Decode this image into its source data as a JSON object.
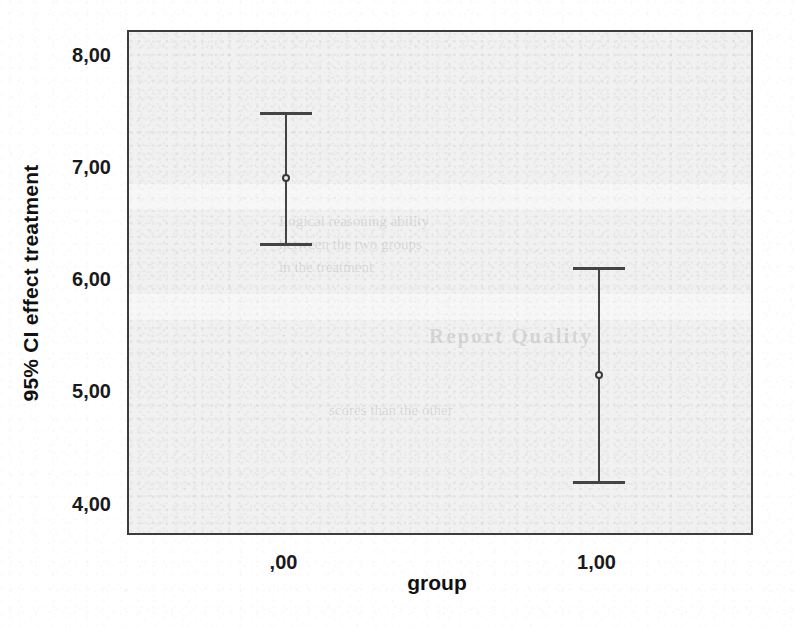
{
  "chart_data": {
    "type": "scatter",
    "title": "",
    "subtitle": "",
    "xlabel": "group",
    "ylabel": "95% CI effect treatment",
    "categories": [
      ",00",
      "1,00"
    ],
    "x": [
      0,
      1
    ],
    "xlim": [
      -0.5,
      1.5
    ],
    "ylim": [
      3.72,
      8.22
    ],
    "grid": false,
    "legend": null,
    "error_kind": "95% confidence interval",
    "ytick_labels": [
      "8,00",
      "7,00",
      "6,00",
      "5,00",
      "4,00"
    ],
    "ytick_values": [
      8.0,
      7.0,
      6.0,
      5.0,
      4.0
    ],
    "xtick_labels": [
      ",00",
      "1,00"
    ],
    "xtick_values": [
      0,
      1
    ],
    "series": [
      {
        "name": "95% CI effect treatment",
        "points": [
          {
            "category": ",00",
            "x": 0,
            "mean": 6.92,
            "ci_lower": 6.34,
            "ci_upper": 7.51
          },
          {
            "category": "1,00",
            "x": 1,
            "mean": 5.16,
            "ci_lower": 4.22,
            "ci_upper": 6.13
          }
        ],
        "values": [
          6.92,
          5.16
        ],
        "ci_lower": [
          6.34,
          4.22
        ],
        "ci_upper": [
          7.51,
          6.13
        ]
      }
    ],
    "marker": "open-circle",
    "colors": {
      "plot_background": "#f1f1f1",
      "figure_background": "#ffffff",
      "frame": "#3c3c3c",
      "errorbar": "#444444",
      "text": "#111111"
    }
  },
  "axes": {
    "y": {
      "title": "95% CI effect treatment",
      "ticks": [
        {
          "label": "8,00",
          "value": 8.0
        },
        {
          "label": "7,00",
          "value": 7.0
        },
        {
          "label": "6,00",
          "value": 6.0
        },
        {
          "label": "5,00",
          "value": 5.0
        },
        {
          "label": "4,00",
          "value": 4.0
        }
      ]
    },
    "x": {
      "title": "group",
      "ticks": [
        {
          "label": ",00",
          "value": 0
        },
        {
          "label": "1,00",
          "value": 1
        }
      ]
    }
  },
  "bleed_through": {
    "line_a1": "Logical reasoning ability",
    "line_a2": "hetween the two groups",
    "line_a3": "in the treatment",
    "block_b": "Report Quality",
    "line_c": "scores than the other"
  }
}
